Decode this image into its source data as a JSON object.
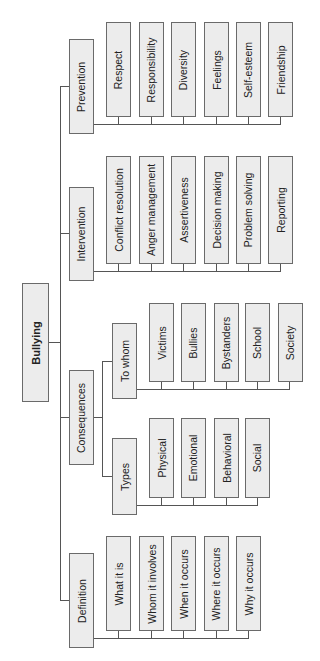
{
  "root": {
    "label": "Bullying"
  },
  "branches": {
    "prevention": {
      "label": "Prevention",
      "items": [
        "Respect",
        "Responsibility",
        "Diversity",
        "Feelings",
        "Self-esteem",
        "Friendship"
      ]
    },
    "intervention": {
      "label": "Intervention",
      "items": [
        "Conflict resolution",
        "Anger management",
        "Assertiveness",
        "Decision making",
        "Problem solving",
        "Reporting"
      ]
    },
    "consequences": {
      "label": "Consequences",
      "to_whom": {
        "label": "To whom",
        "items": [
          "Victims",
          "Bullies",
          "Bystanders",
          "School",
          "Society"
        ]
      },
      "types": {
        "label": "Types",
        "items": [
          "Physical",
          "Emotional",
          "Behavioral",
          "Social"
        ]
      }
    },
    "definition": {
      "label": "Definition",
      "items": [
        "What it is",
        "Whom it involves",
        "When it occurs",
        "Where it occurs",
        "Why it occurs"
      ]
    }
  }
}
